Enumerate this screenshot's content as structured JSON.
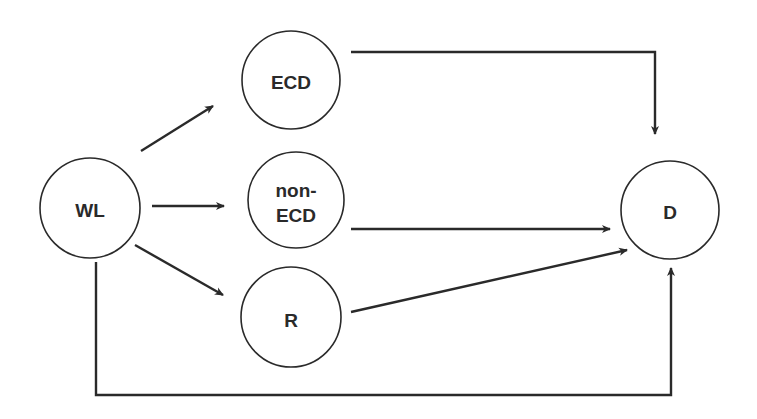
{
  "diagram": {
    "type": "flow",
    "colors": {
      "stroke": "#2a2a2a",
      "background": "#ffffff",
      "node_fill": "#ffffff"
    },
    "nodes": {
      "wl": {
        "label": "WL"
      },
      "ecd": {
        "label": "ECD"
      },
      "nonecd": {
        "label_line1": "non-",
        "label_line2": "ECD"
      },
      "r": {
        "label": "R"
      },
      "d": {
        "label": "D"
      }
    },
    "edges": [
      {
        "from": "WL",
        "to": "ECD"
      },
      {
        "from": "WL",
        "to": "non-ECD"
      },
      {
        "from": "WL",
        "to": "R"
      },
      {
        "from": "ECD",
        "to": "D"
      },
      {
        "from": "non-ECD",
        "to": "D"
      },
      {
        "from": "R",
        "to": "D"
      },
      {
        "from": "WL",
        "to": "D"
      }
    ]
  }
}
